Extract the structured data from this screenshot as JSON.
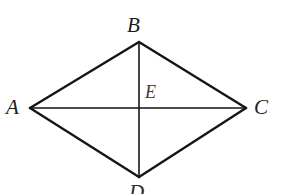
{
  "figure": {
    "type": "geometry-diagram",
    "shape": "rhombus",
    "background_color": "#ffffff",
    "stroke_color": "#151515",
    "outline_stroke_width": 2.4,
    "diagonal_stroke_width": 1.6,
    "canvas": {
      "width": 293,
      "height": 194
    }
  },
  "points": {
    "A": {
      "label": "A",
      "x": 30,
      "y": 108
    },
    "B": {
      "label": "B",
      "x": 139,
      "y": 42
    },
    "C": {
      "label": "C",
      "x": 246,
      "y": 108
    },
    "D": {
      "label": "D",
      "x": 139,
      "y": 177
    },
    "E": {
      "label": "E",
      "x": 139,
      "y": 108
    }
  },
  "edges": [
    {
      "name": "side-AB",
      "from": "A",
      "to": "B",
      "kind": "outline"
    },
    {
      "name": "side-BC",
      "from": "B",
      "to": "C",
      "kind": "outline"
    },
    {
      "name": "side-CD",
      "from": "C",
      "to": "D",
      "kind": "outline"
    },
    {
      "name": "side-DA",
      "from": "D",
      "to": "A",
      "kind": "outline"
    },
    {
      "name": "diagonal-AC",
      "from": "A",
      "to": "C",
      "kind": "diagonal"
    },
    {
      "name": "diagonal-BD",
      "from": "B",
      "to": "D",
      "kind": "diagonal"
    }
  ],
  "labels": {
    "A": "A",
    "B": "B",
    "C": "C",
    "D": "D",
    "E": "E"
  }
}
